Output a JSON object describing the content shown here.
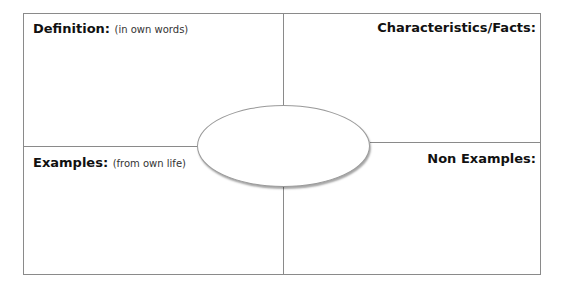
{
  "quadrants": {
    "definition": {
      "title": "Definition:",
      "hint": "(in own words)"
    },
    "characteristics": {
      "title": "Characteristics/Facts:"
    },
    "examples": {
      "title": "Examples:",
      "hint": "(from own life)"
    },
    "non_examples": {
      "title": "Non Examples:"
    }
  },
  "center": {
    "text": ""
  }
}
